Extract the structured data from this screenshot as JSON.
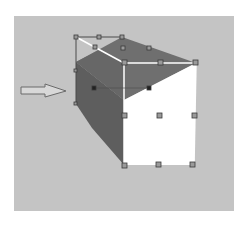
{
  "figure": {
    "colors": {
      "background": "#c4c4c4",
      "top_face": "#6f6f6f",
      "side_face": "#5e5e5e",
      "front_face": "#ffffff",
      "edge_highlight": "#ffffff",
      "handle_fill": "#9a9a9a",
      "handle_stroke": "#3a3a3a",
      "arrow_fill": "#d8d8d8",
      "arrow_stroke": "#6a6a6a"
    },
    "arrow": {
      "direction": "right",
      "label": ""
    },
    "handles": [
      [
        76,
        37
      ],
      [
        99,
        37
      ],
      [
        122,
        37
      ],
      [
        95,
        47
      ],
      [
        123,
        48
      ],
      [
        149,
        48
      ],
      [
        125,
        63
      ],
      [
        161,
        62
      ],
      [
        196,
        63
      ],
      [
        95,
        88
      ],
      [
        149,
        88
      ],
      [
        124,
        115
      ],
      [
        159,
        115
      ],
      [
        194,
        115
      ],
      [
        124,
        165
      ],
      [
        158,
        165
      ],
      [
        192,
        165
      ]
    ]
  }
}
